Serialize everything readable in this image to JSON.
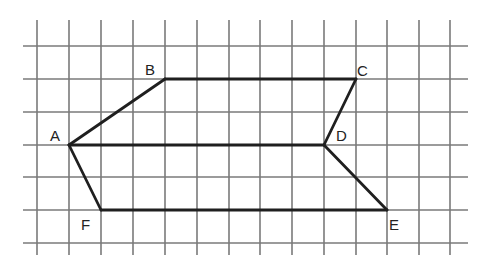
{
  "diagram": {
    "type": "grid-figure",
    "colors": {
      "background": "#ffffff",
      "grid": "#7a7a7a",
      "edges": "#1f1f1f",
      "labels": "#222222"
    },
    "grid": {
      "vertical_x": [
        37,
        69,
        101,
        133,
        165,
        197,
        229,
        260,
        292,
        324,
        356,
        387,
        419,
        450
      ],
      "vertical_y_range": [
        20,
        255
      ],
      "horizontal_y": [
        46,
        79,
        112,
        145,
        177,
        210,
        243
      ],
      "horizontal_x_range": [
        23,
        468
      ]
    },
    "vertices": {
      "A": {
        "x": 69,
        "y": 145,
        "grid": [
          1,
          3
        ]
      },
      "B": {
        "x": 165,
        "y": 79,
        "grid": [
          4,
          1
        ]
      },
      "C": {
        "x": 356,
        "y": 79,
        "grid": [
          10,
          1
        ]
      },
      "D": {
        "x": 324,
        "y": 145,
        "grid": [
          9,
          3
        ]
      },
      "E": {
        "x": 387,
        "y": 210,
        "grid": [
          11,
          5
        ]
      },
      "F": {
        "x": 101,
        "y": 210,
        "grid": [
          2,
          5
        ]
      }
    },
    "edges": [
      [
        "A",
        "B"
      ],
      [
        "B",
        "C"
      ],
      [
        "C",
        "D"
      ],
      [
        "A",
        "D"
      ],
      [
        "D",
        "E"
      ],
      [
        "E",
        "F"
      ],
      [
        "F",
        "A"
      ]
    ],
    "labels": [
      {
        "text": "A",
        "x": 50,
        "y": 141
      },
      {
        "text": "B",
        "x": 145,
        "y": 75
      },
      {
        "text": "C",
        "x": 357,
        "y": 76
      },
      {
        "text": "D",
        "x": 336,
        "y": 141
      },
      {
        "text": "E",
        "x": 389,
        "y": 230
      },
      {
        "text": "F",
        "x": 81,
        "y": 230
      }
    ]
  }
}
